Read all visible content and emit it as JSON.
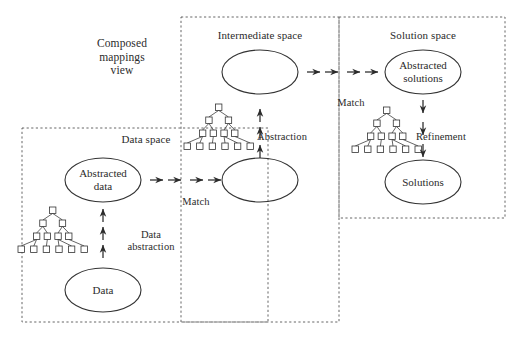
{
  "diagram": {
    "type": "composed-mappings-diagram",
    "view_title": "Composed\nmappings\nview",
    "view_title_lines": [
      "Composed",
      "mappings",
      "view"
    ],
    "colors": {
      "background": "#ffffff",
      "stroke": "#333333",
      "dashed_border": "#555555",
      "text": "#2b2b2b"
    },
    "spaces": [
      {
        "id": "data-space",
        "title": "Data space",
        "box": {
          "x": 22,
          "y": 128,
          "w": 246,
          "h": 194
        }
      },
      {
        "id": "intermediate-space",
        "title": "Intermediate space",
        "box": {
          "x": 181,
          "y": 17,
          "w": 158,
          "h": 305
        }
      },
      {
        "id": "solution-space",
        "title": "Solution space",
        "box": {
          "x": 339,
          "y": 17,
          "w": 166,
          "h": 201
        }
      }
    ],
    "nodes": [
      {
        "id": "abstracted-data",
        "label": "Abstracted\ndata",
        "lines": [
          "Abstracted",
          "data"
        ],
        "cx": 103,
        "cy": 180,
        "rx": 38,
        "ry": 22
      },
      {
        "id": "data",
        "label": "Data",
        "lines": [
          "Data"
        ],
        "cx": 103,
        "cy": 290,
        "rx": 38,
        "ry": 22
      },
      {
        "id": "intermediate-abstracted",
        "label": "",
        "lines": [],
        "cx": 260,
        "cy": 180,
        "rx": 38,
        "ry": 22
      },
      {
        "id": "intermediate-top",
        "label": "",
        "lines": [],
        "cx": 260,
        "cy": 72,
        "rx": 38,
        "ry": 22
      },
      {
        "id": "abstracted-solutions",
        "label": "Abstracted\nsolutions",
        "lines": [
          "Abstracted",
          "solutions"
        ],
        "cx": 423,
        "cy": 72,
        "rx": 38,
        "ry": 22
      },
      {
        "id": "solutions",
        "label": "Solutions",
        "lines": [
          "Solutions"
        ],
        "cx": 423,
        "cy": 182,
        "rx": 38,
        "ry": 22
      }
    ],
    "edges": [
      {
        "id": "data-abstraction",
        "label": "Data\nabstraction",
        "lines": [
          "Data",
          "abstraction"
        ],
        "direction": "up",
        "label_x": 151,
        "label_y": 229
      },
      {
        "id": "match-data-intermediate",
        "label": "Match",
        "lines": [
          "Match"
        ],
        "direction": "right",
        "label_x": 196,
        "label_y": 196
      },
      {
        "id": "abstraction-intermediate",
        "label": "Abstraction",
        "lines": [
          "Abstraction"
        ],
        "direction": "up",
        "label_x": 282,
        "label_y": 131
      },
      {
        "id": "match-intermediate-solution",
        "label": "Match",
        "lines": [
          "Match"
        ],
        "direction": "right",
        "label_x": 351,
        "label_y": 97
      },
      {
        "id": "refinement",
        "label": "Refinement",
        "lines": [
          "Refinement"
        ],
        "direction": "down",
        "label_x": 441,
        "label_y": 131
      }
    ],
    "trees": [
      {
        "id": "tree-data-space",
        "x": 18,
        "y": 207,
        "levels": [
          1,
          2,
          4,
          6
        ]
      },
      {
        "id": "tree-intermediate-space",
        "x": 184,
        "y": 104,
        "levels": [
          1,
          2,
          4,
          6
        ]
      },
      {
        "id": "tree-solution-space",
        "x": 352,
        "y": 107,
        "levels": [
          1,
          2,
          4,
          6
        ]
      }
    ],
    "arrow_groups": [
      {
        "id": "arrows-data-abstraction",
        "kind": "vertical-up",
        "x": 103,
        "ys": [
          258,
          240,
          222
        ]
      },
      {
        "id": "arrows-match-1",
        "kind": "horizontal-right",
        "y": 180,
        "xs": [
          150,
          168,
          190,
          208
        ]
      },
      {
        "id": "arrows-abstraction",
        "kind": "vertical-up",
        "x": 260,
        "ys": [
          158,
          140,
          122
        ]
      },
      {
        "id": "arrows-match-2",
        "kind": "horizontal-right",
        "y": 72,
        "xs": [
          307,
          325,
          347,
          365
        ]
      },
      {
        "id": "arrows-refinement",
        "kind": "vertical-down",
        "x": 423,
        "ys": [
          100,
          122,
          144
        ]
      }
    ]
  }
}
